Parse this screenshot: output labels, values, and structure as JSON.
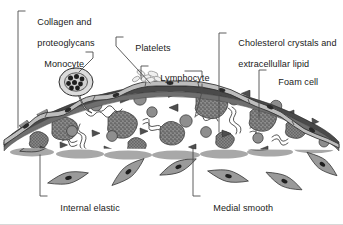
{
  "figure": {
    "background_color": "#ffffff",
    "text_color": "#1a1a1a",
    "leader_color": "#4d4d4d"
  },
  "labels": [
    {
      "id": "collagen",
      "name": "collagen-and-proteoglycans",
      "line1": "Collagen and",
      "line2": "proteoglycans",
      "x": 27,
      "y": 6
    },
    {
      "id": "monocyte",
      "name": "monocyte",
      "line1": "Monocyte",
      "line2": "",
      "x": 34,
      "y": 48
    },
    {
      "id": "platelets",
      "name": "platelets",
      "line1": "Platelets",
      "line2": "",
      "x": 125,
      "y": 32
    },
    {
      "id": "cholesterol",
      "name": "cholesterol-crystals",
      "line1": "Cholesterol crystals and",
      "line2": "extracellullar lipid",
      "x": 228,
      "y": 27
    },
    {
      "id": "lymphocyte",
      "name": "lymphocyte",
      "line1": "Lymphocyte",
      "line2": "",
      "x": 150,
      "y": 62
    },
    {
      "id": "foamcell",
      "name": "foam-cell",
      "line1": "Foam cell",
      "line2": "",
      "x": 268,
      "y": 66
    },
    {
      "id": "iel",
      "name": "internal-elastic-lamina",
      "line1": "Internal elastic",
      "line2": "lamina",
      "x": 50,
      "y": 192
    },
    {
      "id": "smoothmuscle",
      "name": "medial-smooth-muscle-cells",
      "line1": "Medial smooth",
      "line2": "muscle cells",
      "x": 203,
      "y": 192
    }
  ],
  "structures": {
    "endothelium": "endothelial-cell-layer",
    "fibrous_cap": "fibrous-cap-band",
    "lipid_core": "lipid-core",
    "elastic_lamina": "internal-elastic-lamina-band",
    "media": "medial-layer"
  },
  "palette": {
    "endothelium_fill": "#b9b9b9",
    "endothelium_stroke": "#333333",
    "cap_dark": "#4a4a4a",
    "cap_mid": "#6e6e6e",
    "foam_cell_fill": "#7a7a7a",
    "cell_circle_fill": "#8a8a8a",
    "crystal_fill": "#5a5a5a",
    "lamina_fill": "#a9a9a9",
    "smc_fill": "#989898",
    "squiggle_stroke": "#3a3a3a"
  }
}
